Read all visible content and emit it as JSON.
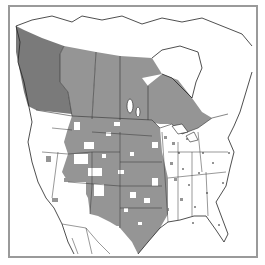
{
  "map": {
    "type": "species-range-map",
    "region": "North America",
    "legend_visible": false,
    "colors": {
      "background": "#ffffff",
      "frame": "#9a9a9a",
      "range_dark": "#7a7a7a",
      "range_medium": "#959595",
      "range_sparse": "#a0a0a0",
      "outline": "#222222"
    },
    "regions": [
      {
        "name": "British Columbia",
        "shade": "range_dark"
      },
      {
        "name": "Alberta",
        "shade": "range_medium"
      },
      {
        "name": "Saskatchewan",
        "shade": "range_medium"
      },
      {
        "name": "Manitoba",
        "shade": "range_medium"
      },
      {
        "name": "Northern Ontario",
        "shade": "range_medium"
      },
      {
        "name": "Great Plains (US)",
        "shade": "range_medium"
      },
      {
        "name": "Texas",
        "shade": "range_medium"
      },
      {
        "name": "Eastern US",
        "shade": "range_sparse"
      }
    ]
  }
}
